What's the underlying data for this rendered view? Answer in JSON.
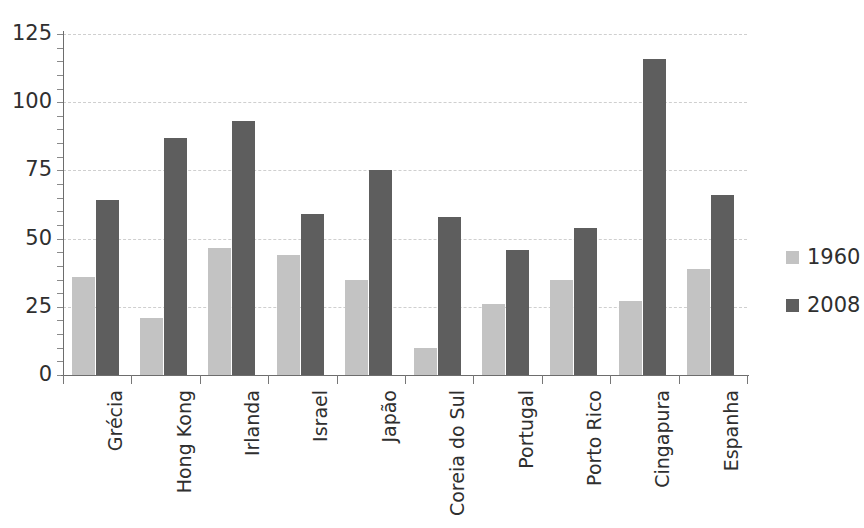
{
  "chart_data": {
    "type": "bar",
    "title": "",
    "subtitle": "",
    "xlabel": "",
    "ylabel": "",
    "ylim": [
      0,
      125
    ],
    "yticks": [
      0,
      25,
      50,
      75,
      100,
      125
    ],
    "grid": true,
    "legend_position": "right",
    "categories": [
      "Grécia",
      "Hong Kong",
      "Irlanda",
      "Israel",
      "Japão",
      "Coreia do Sul",
      "Portugal",
      "Porto Rico",
      "Cingapura",
      "Espanha"
    ],
    "series": [
      {
        "name": "1960",
        "color": "#c3c3c3",
        "values": [
          36,
          21,
          46.5,
          44,
          35,
          10,
          26,
          35,
          27,
          39
        ]
      },
      {
        "name": "2008",
        "color": "#5e5e5e",
        "values": [
          64,
          87,
          93,
          59,
          75,
          58,
          46,
          54,
          116,
          66
        ]
      }
    ]
  },
  "legend": {
    "items": [
      {
        "label": "1960",
        "color": "#c3c3c3"
      },
      {
        "label": "2008",
        "color": "#5e5e5e"
      }
    ]
  },
  "axes": {
    "y_tick_labels": [
      "125",
      "100",
      "75",
      "50",
      "25",
      "0"
    ],
    "x_tick_labels": [
      "Grécia",
      "Hong Kong",
      "Irlanda",
      "Israel",
      "Japão",
      "Coreia do Sul",
      "Portugal",
      "Porto Rico",
      "Cingapura",
      "Espanha"
    ]
  }
}
